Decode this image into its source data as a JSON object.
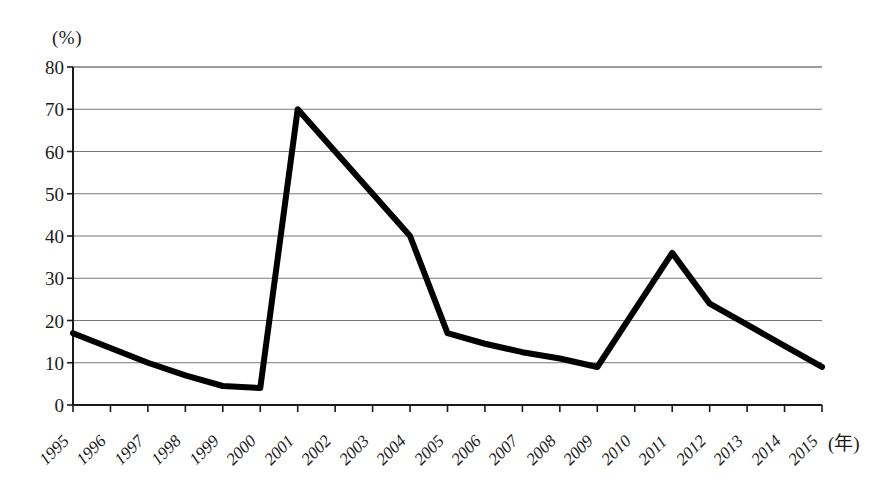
{
  "chart_data": {
    "type": "line",
    "title": "",
    "xlabel": "(年)",
    "ylabel": "(%)",
    "x": [
      1995,
      1996,
      1997,
      1998,
      1999,
      2000,
      2001,
      2002,
      2003,
      2004,
      2005,
      2006,
      2007,
      2008,
      2009,
      2010,
      2011,
      2012,
      2013,
      2014,
      2015
    ],
    "categories": [
      "1995",
      "1996",
      "1997",
      "1998",
      "1999",
      "2000",
      "2001",
      "2002",
      "2003",
      "2004",
      "2005",
      "2006",
      "2007",
      "2008",
      "2009",
      "2010",
      "2011",
      "2012",
      "2013",
      "2014",
      "2015"
    ],
    "values": [
      17,
      13.5,
      10,
      7,
      4.5,
      4,
      70,
      60,
      50,
      40,
      17,
      14.5,
      12.5,
      11,
      9,
      22.5,
      36,
      24,
      19,
      14,
      9
    ],
    "series": [
      {
        "name": "",
        "values": [
          17,
          13.5,
          10,
          7,
          4.5,
          4,
          70,
          60,
          50,
          40,
          17,
          14.5,
          12.5,
          11,
          9,
          22.5,
          36,
          24,
          19,
          14,
          9
        ]
      }
    ],
    "ylim": [
      0,
      80
    ],
    "ytick_values": [
      0,
      10,
      20,
      30,
      40,
      50,
      60,
      70,
      80
    ],
    "ytick_labels": [
      "0",
      "10",
      "20",
      "30",
      "40",
      "50",
      "60",
      "70",
      "80"
    ],
    "xlim": [
      1995,
      2015
    ],
    "grid": "horizontal",
    "legend": "none",
    "line_color": "#000000",
    "grid_color": "#7a7a7a",
    "axis_color": "#1a1a1a"
  },
  "axis": {
    "y_unit_label": "(%)",
    "x_unit_label": "(年)"
  }
}
